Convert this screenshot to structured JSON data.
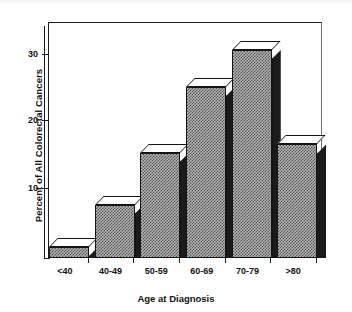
{
  "chart_data": {
    "type": "bar",
    "title": "",
    "xlabel": "Age at Diagnosis",
    "ylabel": "Percent of All Colorectal Cancers",
    "categories": [
      "<40",
      "40-49",
      "50-59",
      "60-69",
      "70-79",
      ">80"
    ],
    "values": [
      1.6,
      7.9,
      15.7,
      25.4,
      30.9,
      16.9
    ],
    "ylim": [
      0,
      35
    ],
    "yticks": [
      10,
      20,
      30
    ],
    "ytick_labels": [
      "10",
      "20",
      "30"
    ],
    "grid": false,
    "legend": null,
    "style": {
      "bar_face": "#b9b9b9",
      "bar_hatch": "#4d4d4d",
      "bar_side": "#1b1b1b",
      "bar_top": "#ffffff",
      "axis_color": "#1a1a1a",
      "background": "#ffffff",
      "three_d": true
    }
  },
  "axes": {
    "y_title": "Percent of All Colorectal Cancers",
    "x_title": "Age at Diagnosis"
  }
}
